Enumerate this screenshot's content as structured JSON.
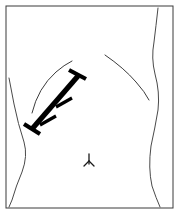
{
  "figure": {
    "kind": "anatomical-line-drawing",
    "canvas": {
      "width": 180,
      "height": 215
    },
    "colors": {
      "background": "#ffffff",
      "frame": "#3a3a3a",
      "contour": "#4a4a4a",
      "rib": "#3c3c3c",
      "incision": "#000000",
      "navel": "#1a1a1a"
    },
    "frame": {
      "label": "panel-border",
      "x": 6,
      "y": 6,
      "width": 167,
      "height": 202
    },
    "contours": [
      {
        "label": "left-flank-contour",
        "path": "M 9 78 L 14 104 Q 18 124 24 142 Q 28 156 22 172 Q 16 186 12 200 L 9 207"
      },
      {
        "label": "right-flank-contour",
        "path": "M 158 8 Q 156 26 154 42 Q 151 58 155 74 Q 160 92 158 110 Q 155 128 151 146 Q 148 168 152 186 Q 156 198 160 207"
      }
    ],
    "rib_arcs": [
      {
        "label": "left-costal-margin",
        "path": "M 32 113 Q 38 88 56 72 Q 64 65 72 61"
      },
      {
        "label": "right-costal-margin",
        "path": "M 105 55 Q 124 68 136 82 Q 145 92 149 100"
      }
    ],
    "incision": {
      "label": "sutured-incision",
      "orientation": "oblique-left-upper-quadrant",
      "bar_path": "M 32 129 L 78 76",
      "end_caps": [
        {
          "label": "distal-cap",
          "path": "M 24 124 L 40 134"
        },
        {
          "label": "proximal-cap",
          "path": "M 69 70 L 86 79"
        }
      ],
      "suture_ticks": [
        {
          "label": "suture-tick-1",
          "path": "M 40 125 L 56 116"
        },
        {
          "label": "suture-tick-2",
          "path": "M 56 107 L 72 98"
        }
      ],
      "suture_count": 2
    },
    "navel": {
      "label": "umbilicus",
      "paths": [
        "M 89 154 L 89 164",
        "M 89 161 L 84 166",
        "M 89 161 L 94 166"
      ]
    }
  }
}
